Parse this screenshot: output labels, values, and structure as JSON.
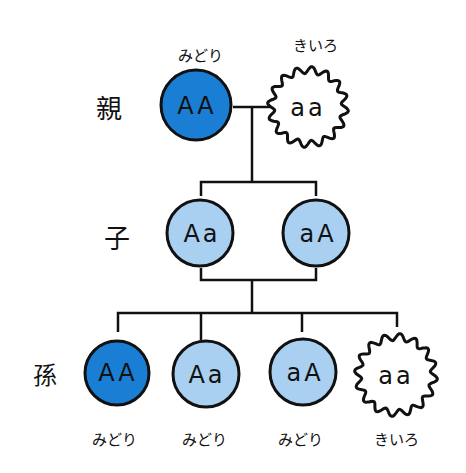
{
  "colors": {
    "dominant_dark": "#1a7fd4",
    "hetero_light": "#a9d0f1",
    "recessive": "#ffffff",
    "line": "#111111"
  },
  "generations": {
    "parent": "親",
    "child": "子",
    "grandchild": "孫"
  },
  "parents": [
    {
      "genotype": "AA",
      "phenotype": "みどり",
      "shape": "circle"
    },
    {
      "genotype": "aa",
      "phenotype": "きいろ",
      "shape": "wavy"
    }
  ],
  "children": [
    {
      "genotype": "Aa"
    },
    {
      "genotype": "aA"
    }
  ],
  "grandchildren": [
    {
      "genotype": "AA",
      "phenotype": "みどり",
      "shape": "circle"
    },
    {
      "genotype": "Aa",
      "phenotype": "みどり",
      "shape": "circle"
    },
    {
      "genotype": "aA",
      "phenotype": "みどり",
      "shape": "circle"
    },
    {
      "genotype": "aa",
      "phenotype": "きいろ",
      "shape": "wavy"
    }
  ]
}
